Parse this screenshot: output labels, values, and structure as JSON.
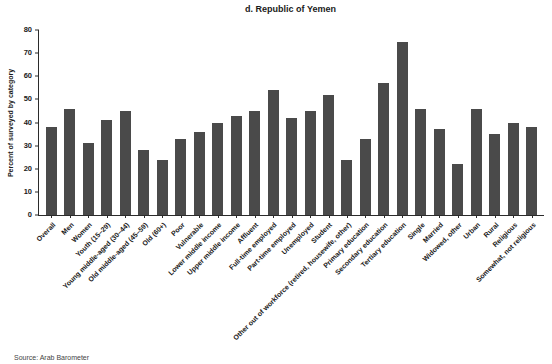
{
  "chart_data": {
    "type": "bar",
    "title": "d. Republic of Yemen",
    "ylabel": "Percent of surveyed by category",
    "xlabel": "",
    "ylim": [
      0,
      80
    ],
    "yticks": [
      0,
      10,
      20,
      30,
      40,
      50,
      60,
      70,
      80
    ],
    "grid": false,
    "legend": false,
    "bar_color": "#4a4a4a",
    "categories": [
      "Overall",
      "Men",
      "Women",
      "Youth (15–29)",
      "Young middle-aged (30–44)",
      "Old middle-aged (45–59)",
      "Old (60+)",
      "Poor",
      "Vulnerable",
      "Lower middle income",
      "Upper middle income",
      "Affluent",
      "Full-time employed",
      "Part-time employed",
      "Unemployed",
      "Student",
      "Other out of workforce (retired, housewife, other)",
      "Primary education",
      "Secondary education",
      "Tertiary education",
      "Single",
      "Married",
      "Widowed, other",
      "Urban",
      "Rural",
      "Religious",
      "Somewhat, not religious"
    ],
    "values": [
      38,
      46,
      31,
      41,
      45,
      28,
      24,
      33,
      36,
      40,
      43,
      45,
      54,
      42,
      45,
      52,
      24,
      33,
      57,
      75,
      46,
      37,
      22,
      46,
      35,
      40,
      38
    ],
    "source": "Source: Arab Barometer"
  }
}
